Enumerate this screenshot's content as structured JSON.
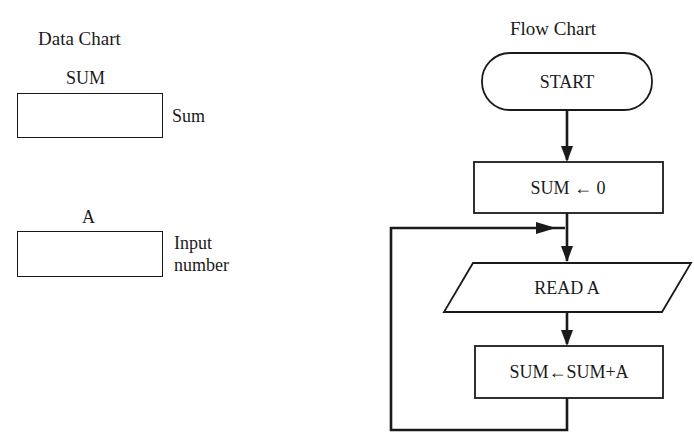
{
  "data_chart": {
    "title": "Data Chart",
    "variables": [
      {
        "name": "SUM",
        "description": "Sum"
      },
      {
        "name": "A",
        "description_line1": "Input",
        "description_line2": "number"
      }
    ]
  },
  "flow_chart": {
    "title": "Flow Chart",
    "nodes": [
      {
        "id": "start",
        "shape": "terminator",
        "label": "START"
      },
      {
        "id": "init",
        "shape": "process",
        "label": "SUM ← 0"
      },
      {
        "id": "read",
        "shape": "input-output",
        "label": "READ A"
      },
      {
        "id": "accumulate",
        "shape": "process",
        "label": "SUM←SUM+A"
      }
    ],
    "edges": [
      {
        "from": "start",
        "to": "init"
      },
      {
        "from": "init",
        "to": "read"
      },
      {
        "from": "read",
        "to": "accumulate"
      },
      {
        "from": "accumulate",
        "to": "read",
        "type": "loop-back"
      }
    ],
    "line_color": "#1a1a1a"
  }
}
